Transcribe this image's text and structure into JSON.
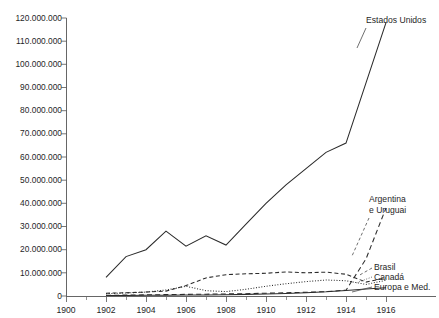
{
  "chart_data": {
    "type": "line",
    "title": "",
    "xlabel": "",
    "ylabel": "",
    "xlim": [
      1900,
      1916
    ],
    "ylim": [
      0,
      120000000
    ],
    "grid": false,
    "legend_position": "right-inline-labels",
    "x_ticks": [
      "1900",
      "1902",
      "1904",
      "1906",
      "1908",
      "1910",
      "1912",
      "1914",
      "1916"
    ],
    "x_tick_values": [
      1900,
      1902,
      1904,
      1906,
      1908,
      1910,
      1912,
      1914,
      1916
    ],
    "y_ticks": [
      "0",
      "10.000.000",
      "20.000.000",
      "30.000.000",
      "40.000.000",
      "50.000.000",
      "60.000.000",
      "70.000.000",
      "80.000.000",
      "90.000.000",
      "100.000.000",
      "110.000.000",
      "120.000.000"
    ],
    "y_tick_values": [
      0,
      10000000,
      20000000,
      30000000,
      40000000,
      50000000,
      60000000,
      70000000,
      80000000,
      90000000,
      100000000,
      110000000,
      120000000
    ],
    "series": [
      {
        "name": "Estados Unidos",
        "style": "solid",
        "color": "#2b2b2b",
        "label_x": 1916.2,
        "label_y": 122000000,
        "x": [
          1902,
          1903,
          1904,
          1905,
          1906,
          1907,
          1908,
          1909,
          1910,
          1911,
          1912,
          1913,
          1914,
          1915,
          1916
        ],
        "values": [
          8000000,
          17000000,
          20000000,
          28000000,
          21500000,
          26000000,
          22000000,
          31000000,
          40000000,
          48000000,
          55000000,
          62000000,
          66000000,
          92000000,
          118000000
        ]
      },
      {
        "name": "Argentina e Uruguai",
        "style": "dashed-long",
        "color": "#2b2b2b",
        "label_x": 1916.2,
        "label_y": 42000000,
        "x": [
          1902,
          1903,
          1904,
          1905,
          1906,
          1907,
          1908,
          1909,
          1910,
          1911,
          1912,
          1913,
          1914,
          1915,
          1916
        ],
        "values": [
          300000,
          400000,
          500000,
          600000,
          700000,
          800000,
          900000,
          1000000,
          1200000,
          1400000,
          1600000,
          1900000,
          2500000,
          16000000,
          38000000
        ]
      },
      {
        "name": "Brasil",
        "style": "dashed",
        "color": "#2b2b2b",
        "label_x": 1916.2,
        "label_y": 11500000,
        "x": [
          1902,
          1903,
          1904,
          1905,
          1906,
          1907,
          1908,
          1909,
          1910,
          1911,
          1912,
          1913,
          1914,
          1915,
          1916
        ],
        "values": [
          1200000,
          1400000,
          1700000,
          2100000,
          4500000,
          7800000,
          9200000,
          9600000,
          9800000,
          10400000,
          10000000,
          10300000,
          9400000,
          6000000,
          7800000
        ]
      },
      {
        "name": "Canadá",
        "style": "dotted",
        "color": "#2b2b2b",
        "label_x": 1916.2,
        "label_y": 7500000,
        "x": [
          1902,
          1903,
          1904,
          1905,
          1906,
          1907,
          1908,
          1909,
          1910,
          1911,
          1912,
          1913,
          1914,
          1915,
          1916
        ],
        "values": [
          1000000,
          1300000,
          1700000,
          2600000,
          4200000,
          2300000,
          1900000,
          2900000,
          4200000,
          5300000,
          6200000,
          6900000,
          6600000,
          5000000,
          6800000
        ]
      },
      {
        "name": "Europa e Med.",
        "style": "solid-thin",
        "color": "#2b2b2b",
        "label_x": 1916.2,
        "label_y": 3800000,
        "x": [
          1902,
          1903,
          1904,
          1905,
          1906,
          1907,
          1908,
          1909,
          1910,
          1911,
          1912,
          1913,
          1914,
          1915,
          1916
        ],
        "values": [
          200000,
          250000,
          300000,
          350000,
          400000,
          450000,
          500000,
          700000,
          900000,
          1100000,
          1400000,
          1800000,
          2400000,
          3000000,
          3600000
        ]
      }
    ]
  },
  "labels": {
    "estados_unidos": "Estados Unidos",
    "argentina_line1": "Argentina",
    "argentina_line2": "e Uruguai",
    "brasil": "Brasil",
    "canada": "Canadá",
    "europa": "Europa e Med.",
    "y0": "0",
    "y10": "10.000.000",
    "y20": "20.000.000",
    "y30": "30.000.000",
    "y40": "40.000.000",
    "y50": "50.000.000",
    "y60": "60.000.000",
    "y70": "70.000.000",
    "y80": "80.000.000",
    "y90": "90.000.000",
    "y100": "100.000.000",
    "y110": "110.000.000",
    "y120": "120.000.000",
    "x1900": "1900",
    "x1902": "1902",
    "x1904": "1904",
    "x1906": "1906",
    "x1908": "1908",
    "x1910": "1910",
    "x1912": "1912",
    "x1914": "1914",
    "x1916": "1916"
  }
}
